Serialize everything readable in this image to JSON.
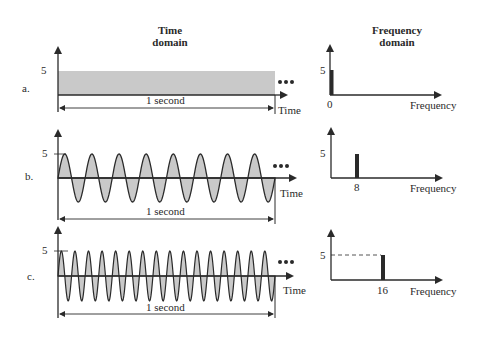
{
  "headers": {
    "time_domain": [
      "Time",
      "domain"
    ],
    "frequency_domain": [
      "Frequency",
      "domain"
    ]
  },
  "panels": [
    {
      "label": "a.",
      "amplitude_label": "5",
      "duration_label": "1 second",
      "time_axis_label": "Time",
      "ellipsis": "•••",
      "freq_tick": "0",
      "freq_axis_label": "Frequency",
      "freq_amp_label": "5",
      "signal": "constant",
      "cycles": 0
    },
    {
      "label": "b.",
      "amplitude_label": "5",
      "duration_label": "1 second",
      "time_axis_label": "Time",
      "ellipsis": "•••",
      "freq_tick": "8",
      "freq_axis_label": "Frequency",
      "freq_amp_label": "5",
      "signal": "sine",
      "cycles": 8
    },
    {
      "label": "c.",
      "amplitude_label": "5",
      "duration_label": "1 second",
      "time_axis_label": "Time",
      "ellipsis": "•••",
      "freq_tick": "16",
      "freq_axis_label": "Frequency",
      "freq_amp_label": "5",
      "signal": "sine",
      "cycles": 16
    }
  ],
  "colors": {
    "ink": "#2a2a2a",
    "fill": "#c9c9c9",
    "bg": "#ffffff"
  },
  "chart_data": [
    {
      "type": "line",
      "title": "a. Time domain",
      "xlabel": "Time",
      "ylabel": "",
      "description": "Constant signal amplitude 5 over 1 second",
      "x": [
        0,
        1
      ],
      "y": [
        5,
        5
      ]
    },
    {
      "type": "bar",
      "title": "a. Frequency domain",
      "xlabel": "Frequency",
      "categories": [
        "0"
      ],
      "values": [
        5
      ]
    },
    {
      "type": "line",
      "title": "b. Time domain",
      "xlabel": "Time",
      "description": "Sine wave amplitude 5, 8 cycles in 1 second",
      "frequency_hz": 8,
      "amplitude": 5
    },
    {
      "type": "bar",
      "title": "b. Frequency domain",
      "xlabel": "Frequency",
      "categories": [
        "8"
      ],
      "values": [
        5
      ]
    },
    {
      "type": "line",
      "title": "c. Time domain",
      "xlabel": "Time",
      "description": "Sine wave amplitude 5, 16 cycles in 1 second",
      "frequency_hz": 16,
      "amplitude": 5
    },
    {
      "type": "bar",
      "title": "c. Frequency domain",
      "xlabel": "Frequency",
      "categories": [
        "16"
      ],
      "values": [
        5
      ]
    }
  ]
}
